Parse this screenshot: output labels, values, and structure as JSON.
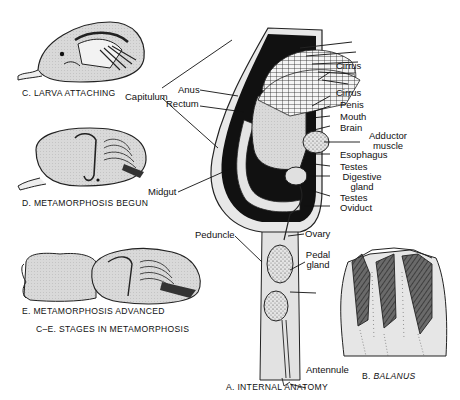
{
  "figure": {
    "panels": {
      "C": {
        "caption": "C. LARVA ATTACHING"
      },
      "D": {
        "caption": "D. METAMORPHOSIS BEGUN"
      },
      "E": {
        "caption": "E. METAMORPHOSIS ADVANCED"
      },
      "CE": {
        "caption": "C–E. STAGES IN METAMORPHOSIS"
      },
      "A": {
        "caption": "A. INTERNAL ANATOMY"
      },
      "B": {
        "caption_prefix": "B. ",
        "caption_name": "BALANUS"
      }
    },
    "labels": {
      "capitulum": "Capitulum",
      "anus": "Anus",
      "rectum": "Rectum",
      "midgut": "Midgut",
      "peduncle": "Peduncle",
      "cirrus_1": "Cirrus",
      "cirrus_2": "Cirrus",
      "penis": "Penis",
      "mouth": "Mouth",
      "brain": "Brain",
      "adductor_1": "Adductor",
      "adductor_2": "muscle",
      "esophagus": "Esophagus",
      "testes_1": "Testes",
      "digestive_1": "Digestive",
      "digestive_2": "gland",
      "testes_2": "Testes",
      "oviduct": "Oviduct",
      "ovary": "Ovary",
      "pedal_1": "Pedal",
      "pedal_2": "gland",
      "antennule": "Antennule"
    },
    "colors": {
      "ink": "#111111",
      "shell_light": "#e6e6e6",
      "shell_mid": "#cfcfcf",
      "plate_dark": "#5a5a5a",
      "background": "#ffffff"
    }
  }
}
